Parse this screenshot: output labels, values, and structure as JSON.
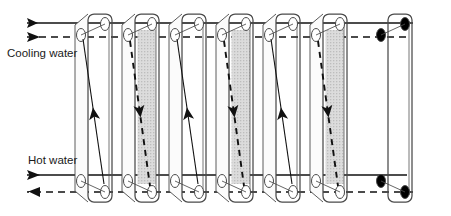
{
  "figure": {
    "type": "technical-diagram",
    "width": 451,
    "height": 216,
    "background_color": "#ffffff"
  },
  "labels": {
    "cooling_water": "Cooling water",
    "hot_water": "Hot water"
  },
  "colors": {
    "line": "#1a1a1a",
    "plate_outline": "#4a4a4a",
    "plate_shading": "#d8d8d8",
    "port_fill": "#ffffff",
    "end_port_fill": "#000000",
    "background": "#ffffff"
  },
  "streams": [
    {
      "name": "cooling-water-inlet",
      "label": "Cooling water",
      "line_style": "dashed",
      "position": "top",
      "direction": "right",
      "y": 37
    },
    {
      "name": "hot-water-outlet",
      "label": "",
      "line_style": "solid",
      "position": "top",
      "direction": "left",
      "y": 23
    },
    {
      "name": "hot-water-inlet",
      "label": "Hot water",
      "line_style": "solid",
      "position": "bottom",
      "direction": "right",
      "y": 175
    },
    {
      "name": "cooling-water-outlet",
      "label": "",
      "line_style": "dashed",
      "position": "bottom",
      "direction": "left",
      "y": 192
    }
  ],
  "plates": [
    {
      "index": 1,
      "x": 88,
      "type": "hot",
      "shaded": false,
      "arrow": "up",
      "arrow_style": "solid",
      "end_plate": false
    },
    {
      "index": 2,
      "x": 135,
      "type": "cooling",
      "shaded": true,
      "arrow": "down",
      "arrow_style": "dashed",
      "end_plate": false
    },
    {
      "index": 3,
      "x": 182,
      "type": "hot",
      "shaded": false,
      "arrow": "up",
      "arrow_style": "solid",
      "end_plate": false
    },
    {
      "index": 4,
      "x": 229,
      "type": "cooling",
      "shaded": true,
      "arrow": "down",
      "arrow_style": "dashed",
      "end_plate": false
    },
    {
      "index": 5,
      "x": 276,
      "type": "hot",
      "shaded": false,
      "arrow": "up",
      "arrow_style": "solid",
      "end_plate": false
    },
    {
      "index": 6,
      "x": 323,
      "type": "cooling",
      "shaded": true,
      "arrow": "down",
      "arrow_style": "dashed",
      "end_plate": false
    },
    {
      "index": 7,
      "x": 388,
      "type": "end",
      "shaded": false,
      "arrow": "none",
      "arrow_style": "none",
      "end_plate": true
    }
  ],
  "plate_count": 7,
  "geometry": {
    "plate_width": 24,
    "plate_top_y": 14,
    "plate_bottom_y": 202,
    "skew_x": 13,
    "port_radius_x": 4.5,
    "port_radius_y": 6.5
  }
}
